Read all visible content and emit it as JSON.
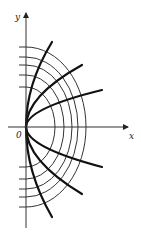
{
  "figure": {
    "origin": {
      "x": 26,
      "y": 127
    },
    "axes": {
      "x_label": "x",
      "y_label": "y",
      "origin_label": "0",
      "x_axis": {
        "x1": 8,
        "x2": 128
      },
      "y_axis": {
        "y1": 228,
        "y2": 13
      }
    },
    "ellipses": [
      {
        "rx": 29,
        "ry": 40
      },
      {
        "rx": 38,
        "ry": 52
      },
      {
        "rx": 46,
        "ry": 62
      },
      {
        "rx": 52,
        "ry": 70
      },
      {
        "rx": 60,
        "ry": 80
      }
    ],
    "parabolas": [
      {
        "end_dx": 26,
        "end_dy": -85
      },
      {
        "end_dx": 56,
        "end_dy": -62
      },
      {
        "end_dx": 76,
        "end_dy": -37
      },
      {
        "end_dx": 76,
        "end_dy": 40
      },
      {
        "end_dx": 56,
        "end_dy": 67
      },
      {
        "end_dx": 26,
        "end_dy": 90
      }
    ],
    "colors": {
      "ellipse": "#333333",
      "parabola": "#111111",
      "axis": "#333333"
    }
  }
}
